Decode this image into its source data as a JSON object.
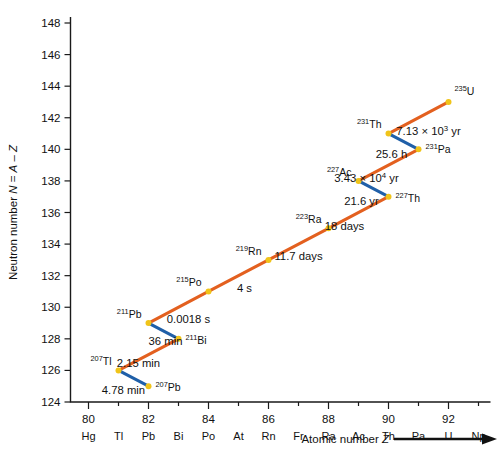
{
  "figure": {
    "title": "",
    "y_axis": {
      "label": "Neutron number N = A – Z",
      "ticks": [
        124,
        126,
        128,
        130,
        132,
        134,
        136,
        138,
        140,
        142,
        144,
        146,
        148
      ],
      "min": 124,
      "max": 148
    },
    "x_axis": {
      "label": "Atomic number Z",
      "number_ticks": [
        80,
        82,
        84,
        86,
        88,
        90,
        92
      ],
      "element_symbols": [
        "Hg",
        "Tl",
        "Pb",
        "Bi",
        "Po",
        "At",
        "Rn",
        "Fr",
        "Ra",
        "Ac",
        "Th",
        "Pa",
        "U",
        "Np"
      ],
      "element_z": [
        80,
        81,
        82,
        83,
        84,
        85,
        86,
        87,
        88,
        89,
        90,
        91,
        92,
        93
      ],
      "min": 79.4,
      "max": 93.4
    },
    "colors": {
      "alpha_decay": "#e3601f",
      "beta_decay": "#1f5fa8",
      "node": "#f0c419",
      "axis": "#1a1a1a",
      "background": "#ffffff"
    }
  },
  "chart_data": {
    "type": "scatter",
    "title": "",
    "xlabel": "Atomic number Z",
    "ylabel": "Neutron number N = A – Z",
    "xlim": [
      79.4,
      93.4
    ],
    "ylim": [
      124,
      148
    ],
    "grid": false,
    "legend": "none",
    "nuclides": [
      {
        "mass": "235",
        "symbol": "U",
        "z": 92,
        "n": 143,
        "label_dx": 6,
        "label_dy": -7,
        "anchor": "start"
      },
      {
        "mass": "231",
        "symbol": "Th",
        "z": 90,
        "n": 141,
        "label_dx": -7,
        "label_dy": -6,
        "anchor": "end"
      },
      {
        "mass": "231",
        "symbol": "Pa",
        "z": 91,
        "n": 140,
        "label_dx": 7,
        "label_dy": 4,
        "anchor": "start"
      },
      {
        "mass": "227",
        "symbol": "Ac",
        "z": 89,
        "n": 138,
        "label_dx": -7,
        "label_dy": -5,
        "anchor": "end"
      },
      {
        "mass": "227",
        "symbol": "Th",
        "z": 90,
        "n": 137,
        "label_dx": 7,
        "label_dy": 5,
        "anchor": "start"
      },
      {
        "mass": "223",
        "symbol": "Ra",
        "z": 88,
        "n": 135,
        "label_dx": -7,
        "label_dy": -5,
        "anchor": "end"
      },
      {
        "mass": "219",
        "symbol": "Rn",
        "z": 86,
        "n": 133,
        "label_dx": -7,
        "label_dy": -5,
        "anchor": "end"
      },
      {
        "mass": "215",
        "symbol": "Po",
        "z": 84,
        "n": 131,
        "label_dx": -7,
        "label_dy": -5,
        "anchor": "end"
      },
      {
        "mass": "211",
        "symbol": "Pb",
        "z": 82,
        "n": 129,
        "label_dx": -7,
        "label_dy": -5,
        "anchor": "end"
      },
      {
        "mass": "211",
        "symbol": "Bi",
        "z": 83,
        "n": 128,
        "label_dx": 7,
        "label_dy": 5,
        "anchor": "start"
      },
      {
        "mass": "207",
        "symbol": "Tl",
        "z": 81,
        "n": 126,
        "label_dx": -7,
        "label_dy": -5,
        "anchor": "end"
      },
      {
        "mass": "207",
        "symbol": "Pb",
        "z": 82,
        "n": 125,
        "label_dx": 7,
        "label_dy": 5,
        "anchor": "start"
      }
    ],
    "decays": [
      {
        "from": 0,
        "to": 1,
        "kind": "alpha",
        "halflife": "7.13 × 10",
        "exponent": "3",
        "unit": " yr",
        "label_dx": 10,
        "label_dy": 17
      },
      {
        "from": 1,
        "to": 2,
        "kind": "beta",
        "halflife": "25.6 h",
        "exponent": "",
        "unit": "",
        "label_dx": -12,
        "label_dy": 17
      },
      {
        "from": 2,
        "to": 3,
        "kind": "alpha",
        "halflife": "3.43 × 10",
        "exponent": "4",
        "unit": " yr",
        "label_dx": -22,
        "label_dy": 17
      },
      {
        "from": 3,
        "to": 4,
        "kind": "beta",
        "halflife": "21.6 yr",
        "exponent": "",
        "unit": "",
        "label_dx": -12,
        "label_dy": 16
      },
      {
        "from": 4,
        "to": 5,
        "kind": "alpha",
        "halflife": "18 days",
        "exponent": "",
        "unit": "",
        "label_dx": -14,
        "label_dy": 17
      },
      {
        "from": 5,
        "to": 6,
        "kind": "alpha",
        "halflife": "11.7 days",
        "exponent": "",
        "unit": "",
        "label_dx": 0,
        "label_dy": 16
      },
      {
        "from": 6,
        "to": 7,
        "kind": "alpha",
        "halflife": "4 s",
        "exponent": "",
        "unit": "",
        "label_dx": 6,
        "label_dy": 16
      },
      {
        "from": 7,
        "to": 8,
        "kind": "alpha",
        "halflife": "0.0018 s",
        "exponent": "",
        "unit": "",
        "label_dx": 10,
        "label_dy": 16
      },
      {
        "from": 8,
        "to": 9,
        "kind": "beta",
        "halflife": "36 min",
        "exponent": "",
        "unit": "",
        "label_dx": 2,
        "label_dy": 14
      },
      {
        "from": 9,
        "to": 10,
        "kind": "alpha",
        "halflife": "2.15 min",
        "exponent": "",
        "unit": "",
        "label_dx": -10,
        "label_dy": 12
      },
      {
        "from": 10,
        "to": 11,
        "kind": "beta",
        "halflife": "4.78 min",
        "exponent": "",
        "unit": "",
        "label_dx": -10,
        "label_dy": 16
      }
    ]
  }
}
